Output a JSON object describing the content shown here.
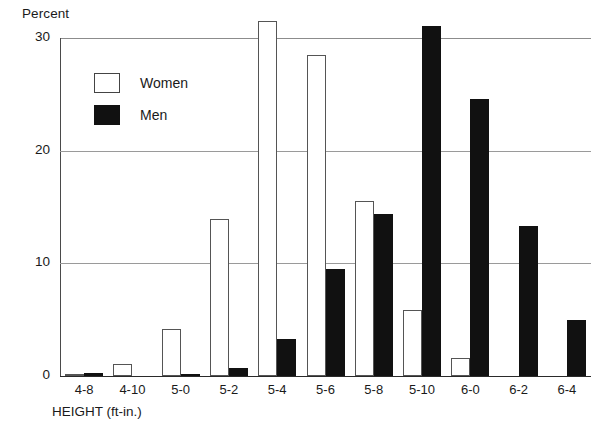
{
  "chart_data": {
    "type": "bar",
    "title": "",
    "ylabel": "Percent",
    "xlabel": "HEIGHT (ft-in.)",
    "ylim": [
      0,
      33
    ],
    "yticks": [
      0,
      10,
      20,
      30
    ],
    "ytick_labels": [
      "0",
      "10",
      "20",
      "30"
    ],
    "grid": true,
    "legend_position": "upper-left-inside",
    "categories": [
      "4-8",
      "4-10",
      "5-0",
      "5-2",
      "5-4",
      "5-6",
      "5-8",
      "5-10",
      "6-0",
      "6-2",
      "6-4"
    ],
    "series": [
      {
        "name": "Women",
        "color": "#ffffff",
        "edge_color": "#555555",
        "values": [
          0.1,
          1.1,
          4.2,
          13.9,
          31.5,
          28.5,
          15.5,
          5.9,
          1.6,
          0.0,
          0.0
        ]
      },
      {
        "name": "Men",
        "color": "#111111",
        "edge_color": "#111111",
        "values": [
          0.3,
          0.0,
          0.2,
          0.7,
          3.3,
          9.5,
          14.4,
          31.1,
          24.6,
          13.3,
          5.0
        ]
      }
    ]
  },
  "legend": {
    "items": [
      {
        "label": "Women",
        "swatch": "women"
      },
      {
        "label": "Men",
        "swatch": "men"
      }
    ]
  }
}
